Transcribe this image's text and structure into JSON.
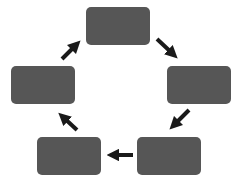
{
  "diagram": {
    "type": "cycle",
    "direction": "clockwise",
    "colors": {
      "background": "#ffffff",
      "node_fill": "#565656",
      "arrow": "#1a1a1a"
    },
    "nodes": [
      {
        "id": "top",
        "label": "",
        "x": 86,
        "y": 7
      },
      {
        "id": "right",
        "label": "",
        "x": 167,
        "y": 66
      },
      {
        "id": "bottom-right",
        "label": "",
        "x": 137,
        "y": 137
      },
      {
        "id": "bottom-left",
        "label": "",
        "x": 37,
        "y": 137
      },
      {
        "id": "left",
        "label": "",
        "x": 11,
        "y": 66
      }
    ],
    "edges": [
      {
        "from": "top",
        "to": "right"
      },
      {
        "from": "right",
        "to": "bottom-right"
      },
      {
        "from": "bottom-right",
        "to": "bottom-left"
      },
      {
        "from": "bottom-left",
        "to": "left"
      },
      {
        "from": "left",
        "to": "top"
      }
    ]
  }
}
